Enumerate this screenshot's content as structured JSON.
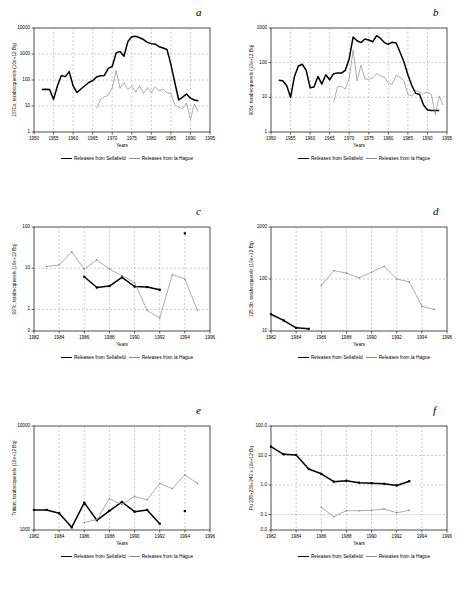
{
  "figure": {
    "legend": {
      "sellafield": "Releases from Sellafield",
      "lahague": "Releases from la Hague"
    },
    "xlabel": "Years"
  },
  "chart_data": [
    {
      "id": "a",
      "letter": "a",
      "type": "line",
      "title": "",
      "xlabel": "Years",
      "ylabel": "137Cs, terabecquerels (10e+12 Bq)",
      "xlim": [
        1950,
        1995
      ],
      "ylim": [
        1,
        10000
      ],
      "yscale": "log",
      "xticks": [
        1950,
        1955,
        1960,
        1965,
        1970,
        1975,
        1980,
        1985,
        1990,
        1995
      ],
      "yticks": [
        1,
        10,
        100,
        1000,
        10000
      ],
      "ytick_labels": [
        "1",
        "10",
        "100",
        "1000",
        "10000"
      ],
      "grid": true,
      "legend_position": "below",
      "series": [
        {
          "name": "Releases from Sellafield",
          "color": "#000000",
          "x": [
            1952,
            1953,
            1954,
            1955,
            1956,
            1957,
            1958,
            1959,
            1960,
            1961,
            1962,
            1963,
            1964,
            1965,
            1966,
            1967,
            1968,
            1969,
            1970,
            1971,
            1972,
            1973,
            1974,
            1975,
            1976,
            1977,
            1978,
            1979,
            1980,
            1981,
            1982,
            1983,
            1984,
            1985,
            1986,
            1987,
            1988,
            1989,
            1990,
            1991,
            1992
          ],
          "values": [
            43,
            44,
            43,
            18,
            60,
            150,
            135,
            210,
            60,
            33,
            45,
            60,
            80,
            95,
            130,
            145,
            150,
            280,
            330,
            1100,
            1250,
            820,
            3000,
            4600,
            4800,
            4200,
            3600,
            2800,
            2500,
            2400,
            1900,
            1700,
            1500,
            400,
            80,
            17,
            22,
            29,
            20,
            17,
            16
          ]
        },
        {
          "name": "Releases from la Hague",
          "color": "#8a8a8a",
          "x": [
            1966,
            1967,
            1968,
            1969,
            1970,
            1971,
            1972,
            1973,
            1974,
            1975,
            1976,
            1977,
            1978,
            1979,
            1980,
            1981,
            1982,
            1983,
            1984,
            1985,
            1986,
            1987,
            1988,
            1989,
            1990,
            1991,
            1992
          ],
          "values": [
            8,
            18,
            22,
            26,
            50,
            230,
            48,
            80,
            44,
            58,
            34,
            60,
            30,
            52,
            33,
            55,
            38,
            45,
            32,
            30,
            11,
            9,
            8,
            13,
            3,
            12,
            6
          ]
        }
      ]
    },
    {
      "id": "b",
      "letter": "b",
      "type": "line",
      "title": "",
      "xlabel": "Years",
      "ylabel": "90Sr, terabecquerels (10e+12 Bq)",
      "xlim": [
        1950,
        1995
      ],
      "ylim": [
        1,
        1000
      ],
      "yscale": "log",
      "xticks": [
        1950,
        1955,
        1960,
        1965,
        1970,
        1975,
        1980,
        1985,
        1990,
        1995
      ],
      "yticks": [
        1,
        10,
        100,
        1000
      ],
      "ytick_labels": [
        "1",
        "10",
        "100",
        "1000"
      ],
      "grid": true,
      "legend_position": "below",
      "series": [
        {
          "name": "Releases from Sellafield",
          "color": "#000000",
          "x": [
            1952,
            1953,
            1954,
            1955,
            1956,
            1957,
            1958,
            1959,
            1960,
            1961,
            1962,
            1963,
            1964,
            1965,
            1966,
            1967,
            1968,
            1969,
            1970,
            1971,
            1972,
            1973,
            1974,
            1975,
            1976,
            1977,
            1978,
            1979,
            1980,
            1981,
            1982,
            1983,
            1984,
            1985,
            1986,
            1987,
            1988,
            1989,
            1990,
            1991,
            1992,
            1993
          ],
          "values": [
            31,
            30,
            22,
            10,
            40,
            80,
            90,
            60,
            19,
            20,
            40,
            24,
            45,
            32,
            48,
            50,
            50,
            60,
            130,
            550,
            430,
            380,
            480,
            450,
            400,
            600,
            500,
            380,
            340,
            390,
            370,
            200,
            105,
            45,
            22,
            13,
            12,
            6,
            4.3,
            4.2,
            4.2,
            4.2
          ]
        },
        {
          "name": "Releases from la Hague",
          "color": "#8a8a8a",
          "x": [
            1966,
            1967,
            1968,
            1969,
            1970,
            1971,
            1972,
            1973,
            1974,
            1975,
            1976,
            1977,
            1978,
            1979,
            1980,
            1981,
            1982,
            1983,
            1984,
            1985,
            1986,
            1987,
            1988,
            1989,
            1990,
            1991,
            1992,
            1993,
            1994
          ],
          "values": [
            7,
            20,
            21,
            17,
            36,
            230,
            30,
            85,
            34,
            33,
            36,
            48,
            42,
            38,
            25,
            24,
            43,
            38,
            30,
            12,
            11,
            16,
            14,
            13,
            14,
            12,
            3.2,
            11,
            6
          ]
        }
      ]
    },
    {
      "id": "c",
      "letter": "c",
      "type": "line",
      "title": "",
      "xlabel": "Years",
      "ylabel": "99Tc, terabecquerels (10e+12 Bq)",
      "xlim": [
        1982,
        1996
      ],
      "ylim": [
        0.3,
        100
      ],
      "yscale": "log",
      "xticks": [
        1982,
        1984,
        1986,
        1988,
        1990,
        1992,
        1994,
        1996
      ],
      "yticks": [
        0.3,
        1,
        10,
        100
      ],
      "ytick_labels": [
        "0",
        "1",
        "10",
        "100"
      ],
      "grid": true,
      "legend_position": "below",
      "series": [
        {
          "name": "Releases from Sellafield",
          "color": "#000000",
          "x": [
            1986,
            1987,
            1988,
            1989,
            1990,
            1991,
            1992,
            1994
          ],
          "values": [
            6.2,
            3.4,
            3.7,
            6.0,
            3.6,
            3.5,
            3.0,
            70
          ]
        },
        {
          "name": "Releases from la Hague",
          "color": "#8a8a8a",
          "x": [
            1983,
            1984,
            1985,
            1986,
            1987,
            1988,
            1989,
            1990,
            1991,
            1992,
            1993,
            1994,
            1995
          ],
          "values": [
            11,
            12,
            25,
            9.5,
            16,
            9.5,
            6.6,
            4.5,
            0.95,
            0.62,
            7.0,
            5.5,
            0.95
          ]
        }
      ]
    },
    {
      "id": "d",
      "letter": "d",
      "type": "line",
      "title": "",
      "xlabel": "Years",
      "ylabel": "125 Sb, terabecquerels (10e+12 Bq)",
      "xlim": [
        1982,
        1996
      ],
      "ylim": [
        10,
        1000
      ],
      "yscale": "log",
      "xticks": [
        1982,
        1984,
        1986,
        1988,
        1990,
        1992,
        1994,
        1996
      ],
      "yticks": [
        10,
        100,
        1000
      ],
      "ytick_labels": [
        "10",
        "100",
        "1000"
      ],
      "grid": true,
      "legend_position": "below",
      "series": [
        {
          "name": "Releases from Sellafield",
          "color": "#000000",
          "x": [
            1982,
            1983,
            1984,
            1985
          ],
          "values": [
            21,
            16,
            11.5,
            11
          ]
        },
        {
          "name": "Releases from la Hague",
          "color": "#8a8a8a",
          "x": [
            1986,
            1987,
            1988,
            1989,
            1990,
            1991,
            1992,
            1993,
            1994,
            1995
          ],
          "values": [
            75,
            145,
            130,
            105,
            135,
            175,
            100,
            88,
            30,
            26
          ]
        }
      ]
    },
    {
      "id": "e",
      "letter": "e",
      "type": "line",
      "title": "",
      "xlabel": "Years",
      "ylabel": "Tritium, terabecquerels (10e+12 Bq)",
      "xlim": [
        1982,
        1996
      ],
      "ylim": [
        1000,
        10000
      ],
      "yscale": "log",
      "xticks": [
        1982,
        1984,
        1986,
        1988,
        1990,
        1992,
        1994,
        1996
      ],
      "yticks": [
        1000,
        10000
      ],
      "ytick_labels": [
        "1000",
        "10000"
      ],
      "grid": true,
      "legend_position": "below",
      "series": [
        {
          "name": "Releases from Sellafield",
          "color": "#000000",
          "x": [
            1982,
            1983,
            1984,
            1985,
            1986,
            1987,
            1988,
            1989,
            1990,
            1991,
            1992,
            1994
          ],
          "values": [
            1560,
            1560,
            1450,
            1060,
            1830,
            1240,
            1530,
            1860,
            1500,
            1560,
            1150,
            1520
          ]
        },
        {
          "name": "Releases from la Hague",
          "color": "#8a8a8a",
          "x": [
            1986,
            1987,
            1988,
            1989,
            1990,
            1991,
            1992,
            1993,
            1994,
            1995
          ],
          "values": [
            1180,
            1260,
            2000,
            1760,
            2100,
            1950,
            2800,
            2500,
            3400,
            2800
          ]
        }
      ]
    },
    {
      "id": "f",
      "letter": "f",
      "type": "line",
      "title": "",
      "xlabel": "Years",
      "ylabel": "Pu 238+239+240 x 10e+12 Bq",
      "xlim": [
        1982,
        1996
      ],
      "ylim": [
        0.03,
        100
      ],
      "yscale": "log",
      "xticks": [
        1982,
        1984,
        1986,
        1988,
        1990,
        1992,
        1994,
        1996
      ],
      "yticks": [
        0.03,
        0.1,
        1.0,
        10.0,
        100.0
      ],
      "ytick_labels": [
        "0.0",
        "0.1",
        "1.0",
        "10.0",
        "100.0"
      ],
      "grid": true,
      "legend_position": "below",
      "series": [
        {
          "name": "Releases from Sellafield",
          "color": "#000000",
          "x": [
            1982,
            1983,
            1984,
            1985,
            1986,
            1987,
            1988,
            1989,
            1990,
            1991,
            1992,
            1993
          ],
          "values": [
            20,
            11,
            10.5,
            3.5,
            2.4,
            1.3,
            1.4,
            1.2,
            1.15,
            1.1,
            0.97,
            1.35
          ]
        },
        {
          "name": "Releases from la Hague",
          "color": "#8a8a8a",
          "x": [
            1986,
            1987,
            1988,
            1989,
            1990,
            1991,
            1992,
            1993
          ],
          "values": [
            0.175,
            0.085,
            0.135,
            0.135,
            0.14,
            0.155,
            0.115,
            0.14
          ]
        }
      ]
    }
  ]
}
